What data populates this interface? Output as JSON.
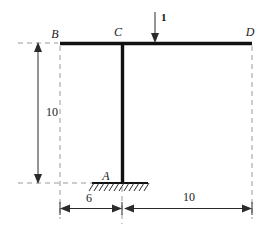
{
  "figure": {
    "type": "structural-frame-diagram"
  },
  "nodes": [
    {
      "id": "B",
      "label": "B",
      "x": 60,
      "y": 43,
      "role": "beam-left-end"
    },
    {
      "id": "C",
      "label": "C",
      "x": 122,
      "y": 43,
      "role": "beam-column-joint"
    },
    {
      "id": "D",
      "label": "D",
      "x": 252,
      "y": 43,
      "role": "beam-right-end"
    },
    {
      "id": "A",
      "label": "A",
      "x": 122,
      "y": 183,
      "role": "fixed-support-base"
    }
  ],
  "members": [
    {
      "id": "BD",
      "from": "B",
      "to": "D",
      "orientation": "horizontal",
      "kind": "beam"
    },
    {
      "id": "CA",
      "from": "C",
      "to": "A",
      "orientation": "vertical",
      "kind": "column"
    }
  ],
  "support": {
    "type": "fixed",
    "at": "A",
    "ground_line_y": 183,
    "ground_x_start": 92,
    "ground_x_end": 148,
    "hatch_count": 11
  },
  "load": {
    "label": "1",
    "magnitude": "1",
    "direction": "down",
    "x": 155,
    "applied_to": "beam BD",
    "tip_y": 43,
    "tail_y": 12
  },
  "dimensions": [
    {
      "id": "height-AC",
      "label": "10",
      "value": "10",
      "orientation": "vertical",
      "from": "beam level B",
      "to": "base level A"
    },
    {
      "id": "span-BC",
      "label": "6",
      "value": "6",
      "orientation": "horizontal",
      "from": "B",
      "to": "C"
    },
    {
      "id": "span-CD",
      "label": "10",
      "value": "10",
      "orientation": "horizontal",
      "from": "C",
      "to": "D"
    }
  ],
  "colors": {
    "member": "#111111",
    "guide": "#9a9a9a",
    "dimension": "#2b2b2b",
    "text": "#1a1a1a",
    "background": "#ffffff"
  }
}
